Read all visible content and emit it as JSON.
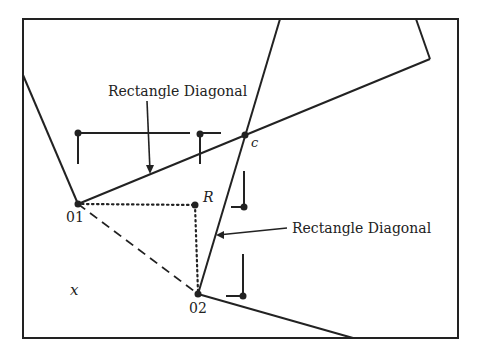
{
  "diagram": {
    "title": "",
    "colors": {
      "stroke": "#222222",
      "background": "#ffffff"
    },
    "frame": {
      "x1": 23,
      "y1": 19,
      "x2": 458,
      "y2": 338
    },
    "labels": {
      "diagonal_top": "Rectangle Diagonal",
      "diagonal_right": "Rectangle Diagonal",
      "point_o1": "01",
      "point_o2": "02",
      "point_r": "R",
      "point_c": "c",
      "region_x": "x"
    },
    "points": {
      "O1": [
        78,
        204
      ],
      "O2": [
        198,
        294
      ],
      "R": [
        195,
        205
      ],
      "c": [
        245,
        135
      ]
    }
  }
}
